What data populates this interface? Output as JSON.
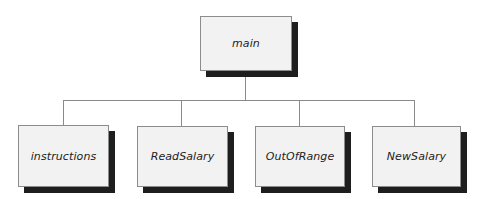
{
  "diagram": {
    "type": "hierarchy-chart",
    "root": {
      "label": "main"
    },
    "children": [
      {
        "label": "instructions"
      },
      {
        "label": "ReadSalary"
      },
      {
        "label": "OutOfRange"
      },
      {
        "label": "NewSalary"
      }
    ],
    "colors": {
      "box_fill": "#f2f2f2",
      "box_border": "#8c8c8c",
      "shadow": "#1e1e1e",
      "connector": "#8a8a8a"
    }
  }
}
